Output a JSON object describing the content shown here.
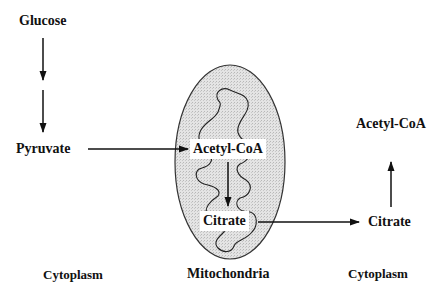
{
  "diagram": {
    "type": "metabolic-pathway",
    "colors": {
      "ink": "#111111",
      "mitochondria_fill": "#dcdcdc",
      "background": "#ffffff",
      "label_box": "#ffffff"
    },
    "nodes": {
      "glucose": "Glucose",
      "pyruvate": "Pyruvate",
      "acetyl_coa_mito": "Acetyl-CoA",
      "citrate_mito": "Citrate",
      "citrate_cyto": "Citrate",
      "acetyl_coa_cyto": "Acetyl-CoA"
    },
    "regions": {
      "cytoplasm_left": "Cytoplasm",
      "mitochondria": "Mitochondria",
      "cytoplasm_right": "Cytoplasm"
    },
    "edges": [
      {
        "from": "Glucose",
        "to": "Pyruvate",
        "style": "two-step-down"
      },
      {
        "from": "Pyruvate",
        "to": "Acetyl-CoA (mitochondria)",
        "direction": "right"
      },
      {
        "from": "Acetyl-CoA (mitochondria)",
        "to": "Citrate (mitochondria)",
        "direction": "down"
      },
      {
        "from": "Citrate (mitochondria)",
        "to": "Citrate (cytoplasm)",
        "direction": "right"
      },
      {
        "from": "Citrate (cytoplasm)",
        "to": "Acetyl-CoA (cytoplasm)",
        "direction": "up"
      }
    ]
  }
}
